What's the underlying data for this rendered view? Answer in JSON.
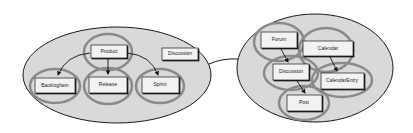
{
  "diagram": {
    "left_cluster": {
      "boxes": [
        {
          "id": "product",
          "label": "Product"
        },
        {
          "id": "discussion",
          "label": "Discussion"
        },
        {
          "id": "backlogitem",
          "label": "BacklogItem"
        },
        {
          "id": "release",
          "label": "Release"
        },
        {
          "id": "sprint",
          "label": "Sprint"
        }
      ]
    },
    "right_cluster": {
      "boxes": [
        {
          "id": "forum",
          "label": "Forum"
        },
        {
          "id": "calendar",
          "label": "Calendar"
        },
        {
          "id": "discussion",
          "label": "Discussion"
        },
        {
          "id": "calendarentry",
          "label": "CalendarEntry"
        },
        {
          "id": "post",
          "label": "Post"
        }
      ]
    },
    "colors": {
      "cluster_fill": "#d9d9d9",
      "ring_stroke": "#8a8a8a",
      "box_fill": "#f2f2f2",
      "outline": "#1a1a1a"
    }
  }
}
